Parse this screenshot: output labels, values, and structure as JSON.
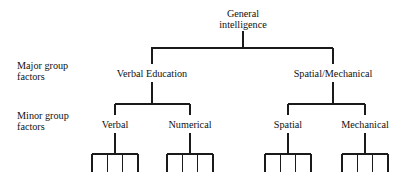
{
  "diagram": {
    "line_color": "#1a1a1a",
    "background_color": "#ffffff",
    "text_color": "#111111"
  },
  "row_labels": [
    {
      "id": "major",
      "line1": "Major group",
      "line2": "factors",
      "x": 17,
      "y": 60
    },
    {
      "id": "minor",
      "line1": "Minor group",
      "line2": "factors",
      "x": 17,
      "y": 110
    }
  ],
  "levels": {
    "root": {
      "id": "general-intelligence",
      "line1": "General",
      "line2": "intelligence",
      "x": 243,
      "y": 8
    },
    "major_factors": [
      {
        "id": "verbal-education",
        "label": "Verbal Education",
        "x": 152,
        "y": 68
      },
      {
        "id": "spatial-mechanical",
        "label": "Spatial/Mechanical",
        "x": 333,
        "y": 68
      }
    ],
    "minor_factors": [
      {
        "id": "verbal",
        "label": "Verbal",
        "x": 115,
        "y": 119,
        "parent": "verbal-education",
        "leaf_count": 4
      },
      {
        "id": "numerical",
        "label": "Numerical",
        "x": 190,
        "y": 119,
        "parent": "verbal-education",
        "leaf_count": 4
      },
      {
        "id": "spatial",
        "label": "Spatial",
        "x": 288,
        "y": 119,
        "parent": "spatial-mechanical",
        "leaf_count": 4
      },
      {
        "id": "mechanical",
        "label": "Mechanical",
        "x": 365,
        "y": 119,
        "parent": "spatial-mechanical",
        "leaf_count": 4
      }
    ]
  },
  "geometry": {
    "root_stem_top": 31,
    "root_stem_bottom": 48,
    "major_bar_y": 48,
    "major_bar_left": 151,
    "major_bar_right": 333,
    "major_stem_bottom": 64,
    "major_label_stem_top": 82,
    "minor_bar_y": 104,
    "minor_half_span": 37,
    "minor_stem_bottom": 115,
    "minor_label_stem_top": 133,
    "comb_bar_y": 154,
    "comb_half_width": 23,
    "comb_tooth_bottom": 172
  },
  "chart_data": {
    "type": "tree",
    "root": "General intelligence",
    "tiers": [
      "Major group factors",
      "Minor group factors"
    ],
    "nodes": [
      {
        "name": "General intelligence",
        "level": 0,
        "parent": null
      },
      {
        "name": "Verbal Education",
        "level": 1,
        "parent": "General intelligence"
      },
      {
        "name": "Spatial/Mechanical",
        "level": 1,
        "parent": "General intelligence"
      },
      {
        "name": "Verbal",
        "level": 2,
        "parent": "Verbal Education",
        "children": 4
      },
      {
        "name": "Numerical",
        "level": 2,
        "parent": "Verbal Education",
        "children": 4
      },
      {
        "name": "Spatial",
        "level": 2,
        "parent": "Spatial/Mechanical",
        "children": 4
      },
      {
        "name": "Mechanical",
        "level": 2,
        "parent": "Spatial/Mechanical",
        "children": 4
      }
    ]
  }
}
